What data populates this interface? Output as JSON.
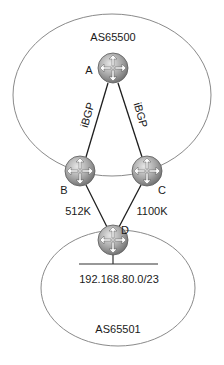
{
  "diagram": {
    "autonomous_systems": [
      {
        "id": "as65500",
        "label": "AS65500"
      },
      {
        "id": "as65501",
        "label": "AS65501"
      }
    ],
    "routers": [
      {
        "id": "A",
        "label": "A",
        "icon": "router-icon"
      },
      {
        "id": "B",
        "label": "B",
        "icon": "router-icon"
      },
      {
        "id": "C",
        "label": "C",
        "icon": "router-icon"
      },
      {
        "id": "D",
        "label": "D",
        "icon": "router-icon"
      }
    ],
    "links": [
      {
        "from": "A",
        "to": "B",
        "label": "iBGP"
      },
      {
        "from": "A",
        "to": "C",
        "label": "iBGP"
      },
      {
        "from": "B",
        "to": "D",
        "label": "512K"
      },
      {
        "from": "C",
        "to": "D",
        "label": "1100K"
      }
    ],
    "network": {
      "label": "192.168.80.0/23",
      "attached_to": "D"
    },
    "colors": {
      "router_fill": "#a8a8a8",
      "ellipse_stroke": "#8a8a8a",
      "link_stroke": "#1e1e1e"
    }
  }
}
